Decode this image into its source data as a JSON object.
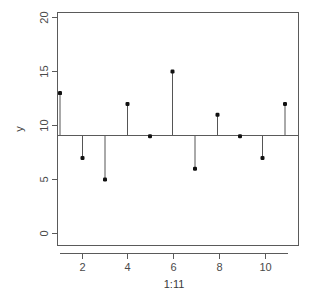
{
  "chart_data": {
    "type": "scatter",
    "subtype": "needle-stem-plot",
    "title": "",
    "xlabel": "1:11",
    "ylabel": "y",
    "x": [
      1,
      2,
      3,
      4,
      5,
      6,
      7,
      8,
      9,
      10,
      11
    ],
    "values": [
      13,
      7,
      5,
      12,
      9,
      15,
      6,
      11,
      9,
      7,
      12
    ],
    "series": [
      {
        "name": "y",
        "values": [
          13,
          7,
          5,
          12,
          9,
          15,
          6,
          11,
          9,
          7,
          12
        ]
      }
    ],
    "baseline": 9.1,
    "xlim": [
      0.55,
      11.45
    ],
    "ylim": [
      0,
      21
    ],
    "xticks": [
      2,
      4,
      6,
      8,
      10
    ],
    "xtick_labels": [
      "2",
      "4",
      "6",
      "8",
      "10"
    ],
    "yticks": [
      0,
      5,
      10,
      15,
      20
    ],
    "ytick_labels": [
      "0",
      "5",
      "10",
      "15",
      "20"
    ],
    "grid": false,
    "legend": false,
    "legend_position": "none",
    "colors": {
      "background": "#ffffff",
      "axis": "#5a5a5a",
      "needle": "#555555",
      "marker": "#111111",
      "text": "#4a4a4a"
    }
  },
  "figure": {
    "ylabel_text": "y",
    "xlabel_text": "1:11"
  }
}
